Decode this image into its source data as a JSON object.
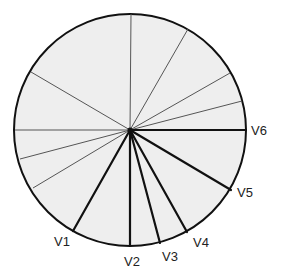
{
  "diagram": {
    "type": "precordial-lead-axes",
    "colors": {
      "fill": "#eeeeee",
      "circle_stroke": "#111111",
      "thin_line": "#555555",
      "lead_line": "#111111",
      "label": "#222222"
    },
    "circle": {
      "cx": 130,
      "cy": 130,
      "r": 116
    },
    "thin_lines": [
      {
        "x2": 131,
        "y2": 14
      },
      {
        "x2": 188,
        "y2": 29
      },
      {
        "x2": 230,
        "y2": 73
      },
      {
        "x2": 242,
        "y2": 101
      },
      {
        "x2": 31,
        "y2": 72
      },
      {
        "x2": 15,
        "y2": 130
      },
      {
        "x2": 20,
        "y2": 159
      },
      {
        "x2": 33,
        "y2": 188
      }
    ],
    "leads": [
      {
        "name": "V1",
        "x2": 73,
        "y2": 231,
        "label_x": 54,
        "label_y": 246
      },
      {
        "name": "V2",
        "x2": 130,
        "y2": 246,
        "label_x": 124,
        "label_y": 266
      },
      {
        "name": "V3",
        "x2": 160,
        "y2": 243,
        "label_x": 162,
        "label_y": 261
      },
      {
        "name": "V4",
        "x2": 187,
        "y2": 232,
        "label_x": 193,
        "label_y": 247
      },
      {
        "name": "V5",
        "x2": 231,
        "y2": 190,
        "label_x": 237,
        "label_y": 197
      },
      {
        "name": "V6",
        "x2": 246,
        "y2": 130,
        "label_x": 251,
        "label_y": 135
      }
    ]
  }
}
